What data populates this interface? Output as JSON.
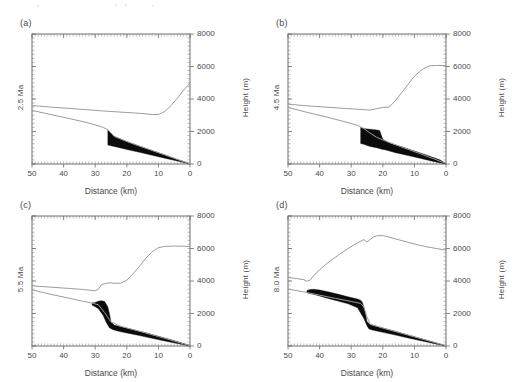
{
  "figure": {
    "panel_count": 4,
    "shared_xlabel": "Distance (km)",
    "shared_ylabel": "Height (m)",
    "xticks": [
      50,
      40,
      30,
      20,
      10,
      0
    ],
    "xticklabels": [
      "50",
      "40",
      "30",
      "20",
      "10",
      "0"
    ],
    "yticks": [
      0,
      2000,
      4000,
      6000,
      8000
    ],
    "yticklabels": [
      "0",
      "2000",
      "4000",
      "6000",
      "8000"
    ],
    "colors": {
      "topography_line": "#9c9c9c",
      "basement_line": "#9c9c9c",
      "wedge_fill": "#0b0b0b",
      "axis": "#6e6e6e",
      "text": "#4a4a4a",
      "background": "#ffffff"
    }
  },
  "chart_data": [
    {
      "type": "line",
      "panel": "a",
      "title": "(a)",
      "age_label": "2.5 Ma",
      "xlabel": "Distance (km)",
      "ylabel": "Height (m)",
      "xlim": [
        50,
        0
      ],
      "ylim": [
        0,
        8000
      ],
      "x_reversed": true,
      "grid": false,
      "legend": "none",
      "series": [
        {
          "name": "topography",
          "x": [
            50,
            44,
            38,
            32,
            28,
            24,
            20,
            16,
            12,
            10,
            8,
            6,
            4,
            2,
            0
          ],
          "values": [
            3600,
            3500,
            3420,
            3330,
            3270,
            3220,
            3170,
            3120,
            3050,
            3040,
            3230,
            3600,
            4050,
            4550,
            4980
          ]
        },
        {
          "name": "basement",
          "x": [
            50,
            44,
            38,
            32,
            28,
            26,
            24,
            20,
            16,
            12,
            8,
            4,
            0
          ],
          "values": [
            3300,
            3040,
            2790,
            2520,
            2290,
            2110,
            1700,
            1380,
            1100,
            830,
            560,
            280,
            20
          ]
        }
      ],
      "wedge": {
        "name": "thrust-wedge",
        "top_x": [
          26,
          24,
          20,
          16,
          12,
          8,
          4,
          0
        ],
        "top_y": [
          2110,
          1700,
          1380,
          1100,
          830,
          560,
          280,
          20
        ],
        "bottom_x": [
          0,
          4,
          8,
          12,
          16,
          20,
          24,
          26
        ],
        "bottom_y": [
          0,
          180,
          360,
          540,
          720,
          900,
          1080,
          1170
        ]
      }
    },
    {
      "type": "line",
      "panel": "b",
      "title": "(b)",
      "age_label": "4.5 Ma",
      "xlabel": "Distance (km)",
      "ylabel": "Height (m)",
      "xlim": [
        50,
        0
      ],
      "ylim": [
        0,
        8000
      ],
      "x_reversed": true,
      "grid": false,
      "legend": "none",
      "series": [
        {
          "name": "topography",
          "x": [
            50,
            44,
            38,
            32,
            28,
            24,
            22,
            20,
            18,
            16,
            14,
            12,
            10,
            8,
            6,
            5,
            3,
            0
          ],
          "values": [
            3680,
            3580,
            3500,
            3420,
            3370,
            3320,
            3400,
            3480,
            3500,
            3900,
            4400,
            4900,
            5400,
            5750,
            5980,
            6050,
            6060,
            6060
          ]
        },
        {
          "name": "basement",
          "x": [
            50,
            44,
            38,
            32,
            28,
            26,
            24,
            22,
            20,
            16,
            12,
            8,
            4,
            0
          ],
          "values": [
            3480,
            3180,
            2900,
            2600,
            2380,
            2180,
            1900,
            1650,
            1480,
            1180,
            900,
            620,
            330,
            30
          ]
        }
      ],
      "wedge": {
        "name": "thrust-wedge",
        "top_x": [
          27,
          26,
          25,
          24,
          22,
          21,
          20,
          18,
          14,
          10,
          6,
          2,
          0
        ],
        "top_y": [
          2250,
          2180,
          2160,
          2140,
          2100,
          2060,
          1520,
          1300,
          1060,
          800,
          540,
          260,
          30
        ],
        "bottom_x": [
          0,
          4,
          8,
          12,
          16,
          19,
          20,
          22,
          24,
          25,
          26,
          27
        ],
        "bottom_y": [
          0,
          160,
          340,
          520,
          700,
          860,
          900,
          1000,
          1080,
          1140,
          1210,
          1260
        ]
      }
    },
    {
      "type": "line",
      "panel": "c",
      "title": "(c)",
      "age_label": "5.5 Ma",
      "xlabel": "Distance (km)",
      "ylabel": "Height (m)",
      "xlim": [
        50,
        0
      ],
      "ylim": [
        0,
        8000
      ],
      "x_reversed": true,
      "grid": false,
      "legend": "none",
      "series": [
        {
          "name": "topography",
          "x": [
            50,
            44,
            38,
            34,
            31,
            30,
            29,
            28,
            26,
            25,
            24,
            22,
            20,
            18,
            16,
            14,
            12,
            10,
            8,
            5,
            2,
            0
          ],
          "values": [
            3700,
            3620,
            3540,
            3480,
            3420,
            3400,
            3480,
            3780,
            3880,
            3880,
            3860,
            3860,
            4050,
            4450,
            4900,
            5400,
            5800,
            6050,
            6130,
            6150,
            6140,
            6110
          ]
        },
        {
          "name": "basement",
          "x": [
            50,
            44,
            38,
            34,
            31,
            29,
            27,
            25,
            22,
            18,
            14,
            10,
            6,
            2,
            0
          ],
          "values": [
            3450,
            3180,
            2930,
            2760,
            2640,
            2540,
            2050,
            1480,
            1220,
            1010,
            800,
            580,
            360,
            130,
            30
          ]
        }
      ],
      "wedge": {
        "name": "thrust-wedge",
        "top_x": [
          31,
          30,
          29,
          28,
          27,
          26,
          25.5,
          25,
          24,
          22,
          18,
          14,
          10,
          6,
          2,
          0
        ],
        "top_y": [
          2640,
          2680,
          2760,
          2790,
          2740,
          2400,
          2000,
          1480,
          1290,
          1180,
          1000,
          810,
          600,
          390,
          150,
          30
        ],
        "bottom_x": [
          0,
          4,
          8,
          12,
          16,
          20,
          23,
          24.5,
          25.5,
          26.5,
          27.5,
          29,
          30,
          31
        ],
        "bottom_y": [
          0,
          150,
          310,
          470,
          640,
          800,
          930,
          1010,
          1120,
          1450,
          1900,
          2290,
          2420,
          2520
        ]
      }
    },
    {
      "type": "line",
      "panel": "d",
      "title": "(d)",
      "age_label": "8.0 Ma",
      "xlabel": "Distance (km)",
      "ylabel": "Height (m)",
      "xlim": [
        50,
        0
      ],
      "ylim": [
        0,
        8000
      ],
      "x_reversed": true,
      "grid": false,
      "legend": "none",
      "series": [
        {
          "name": "topography",
          "x": [
            50,
            47,
            45,
            44,
            43,
            42,
            40,
            37,
            34,
            31,
            28,
            26,
            25,
            24,
            23,
            22,
            20,
            18,
            15,
            12,
            9,
            6,
            3,
            0
          ],
          "values": [
            4220,
            4140,
            4080,
            3980,
            4050,
            4300,
            4700,
            5180,
            5600,
            6000,
            6350,
            6550,
            6400,
            6550,
            6700,
            6780,
            6800,
            6700,
            6540,
            6380,
            6230,
            6100,
            6000,
            5900
          ]
        },
        {
          "name": "basement",
          "x": [
            50,
            45,
            40,
            35,
            30,
            27,
            26,
            25,
            24,
            20,
            16,
            12,
            8,
            4,
            0
          ],
          "values": [
            3500,
            3330,
            3130,
            2930,
            2740,
            2620,
            2400,
            1800,
            1330,
            1100,
            890,
            670,
            450,
            230,
            20
          ]
        }
      ],
      "wedge": {
        "name": "thrust-wedge",
        "top_x": [
          44,
          43,
          42,
          40,
          37,
          34,
          31,
          28,
          27,
          26.5,
          26,
          25.5,
          25,
          24,
          20,
          16,
          12,
          8,
          4,
          0
        ],
        "top_y": [
          3420,
          3470,
          3490,
          3450,
          3320,
          3180,
          3030,
          2890,
          2820,
          2700,
          2400,
          2000,
          1500,
          1330,
          1110,
          900,
          680,
          460,
          240,
          20
        ],
        "bottom_x": [
          0,
          4,
          8,
          12,
          16,
          20,
          23,
          24,
          24.5,
          25,
          26,
          28,
          31,
          34,
          37,
          40,
          42,
          43.5,
          44
        ],
        "bottom_y": [
          0,
          160,
          330,
          500,
          670,
          840,
          970,
          1020,
          1080,
          1250,
          1700,
          2350,
          2600,
          2760,
          2910,
          3080,
          3180,
          3250,
          3280
        ]
      }
    }
  ]
}
